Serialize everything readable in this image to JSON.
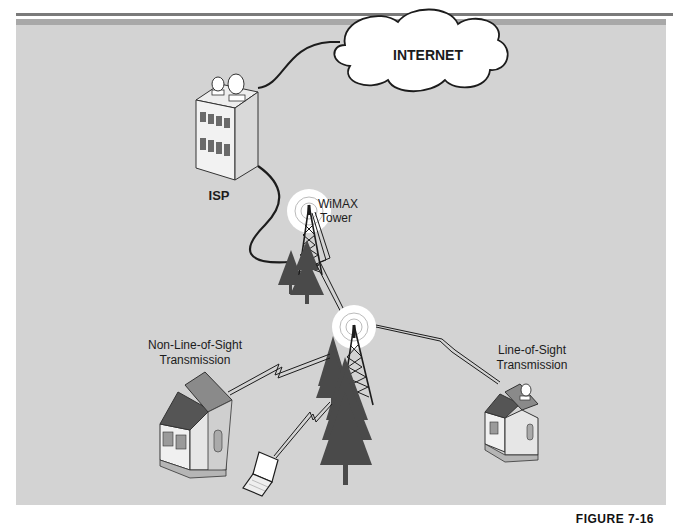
{
  "diagram": {
    "nodes": {
      "internet": {
        "label": "INTERNET"
      },
      "isp": {
        "label": "ISP"
      },
      "wimax_tower": {
        "label_line1": "WiMAX",
        "label_line2": "Tower"
      },
      "relay_tower": {
        "label": ""
      },
      "nlos_house": {
        "caption_line1": "Non-Line-of-Sight",
        "caption_line2": "Transmission"
      },
      "los_house": {
        "caption_line1": "Line-of-Sight",
        "caption_line2": "Transmission"
      },
      "laptop": {
        "label": ""
      }
    },
    "links": [
      {
        "from": "isp",
        "to": "internet",
        "type": "wired"
      },
      {
        "from": "isp",
        "to": "wimax_tower",
        "type": "wired"
      },
      {
        "from": "wimax_tower",
        "to": "relay_tower",
        "type": "wireless"
      },
      {
        "from": "relay_tower",
        "to": "nlos_house",
        "type": "wireless"
      },
      {
        "from": "relay_tower",
        "to": "los_house",
        "type": "wireless"
      },
      {
        "from": "relay_tower",
        "to": "laptop",
        "type": "wireless"
      }
    ],
    "figure_label": "FIGURE 7-16"
  },
  "colors": {
    "panel": "#d3d3d3",
    "band": "#a8a8a8",
    "tree": "#4a4a4a",
    "line": "#1c1c1c"
  }
}
